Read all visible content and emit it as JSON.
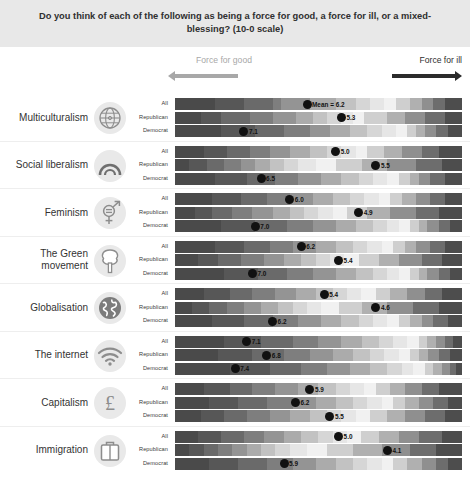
{
  "title": "Do you think of each of the following as being a force for good, a force for ill, or a mixed-blessing? (10-0 scale)",
  "legend": {
    "good_label": "Force for good",
    "ill_label": "Force for ill",
    "good_arrow_icon": "arrow-left-icon",
    "ill_arrow_icon": "arrow-right-icon"
  },
  "series_names": [
    "All",
    "Republican",
    "Democrat"
  ],
  "mean_prefix": "Mean = ",
  "chart_data": {
    "type": "bar",
    "title": "Do you think of each of the following as being a force for good, a force for ill, or a mixed-blessing? (10-0 scale)",
    "xlabel": "",
    "ylabel": "",
    "xlim": [
      10,
      0
    ],
    "scale_note": "10-0 scale: left end = force for good, right end = force for ill",
    "grid": false,
    "legend_position": "top",
    "categories": [
      "Multiculturalism",
      "Social liberalism",
      "Feminism",
      "The Green movement",
      "Globalisation",
      "The internet",
      "Capitalism",
      "Immigration"
    ],
    "groups": [
      "All",
      "Republican",
      "Democrat"
    ],
    "series": [
      {
        "name": "All",
        "values": [
          6.2,
          5.0,
          6.0,
          6.2,
          5.4,
          7.1,
          5.9,
          5.0
        ]
      },
      {
        "name": "Republican",
        "values": [
          5.3,
          5.5,
          4.9,
          5.4,
          4.6,
          6.8,
          6.2,
          4.1
        ]
      },
      {
        "name": "Democrat",
        "values": [
          7.1,
          6.5,
          7.0,
          7.0,
          6.2,
          7.4,
          5.5,
          5.9
        ]
      }
    ]
  },
  "blocks": [
    {
      "label": "Multiculturalism",
      "icon": "globe-icon",
      "rows": [
        {
          "name": "All",
          "value": "6.2",
          "label": "Mean = 6.2",
          "pos": 0.46,
          "segments": [
            14,
            10,
            10,
            3,
            10,
            9,
            7,
            5,
            5,
            4,
            5,
            4,
            4,
            4,
            6
          ]
        },
        {
          "name": "Republican",
          "value": "5.3",
          "label": "5.3",
          "pos": 0.58,
          "segments": [
            9,
            7,
            10,
            8,
            8,
            6,
            5,
            5,
            4,
            4,
            8,
            6,
            7,
            7,
            6
          ]
        },
        {
          "name": "Democrat",
          "value": "7.1",
          "label": "7.1",
          "pos": 0.24,
          "segments": [
            16,
            12,
            10,
            9,
            7,
            7,
            6,
            5,
            5,
            4,
            3,
            3,
            4,
            4,
            5
          ]
        }
      ]
    },
    {
      "label": "Social liberalism",
      "icon": "arch-icon",
      "rows": [
        {
          "name": "All",
          "value": "5.0",
          "label": "5.0",
          "pos": 0.56,
          "segments": [
            10,
            8,
            8,
            7,
            7,
            7,
            6,
            5,
            5,
            4,
            6,
            6,
            7,
            6,
            8
          ]
        },
        {
          "name": "Republican",
          "value": "5.5",
          "label": "5.5",
          "pos": 0.7,
          "segments": [
            5,
            6,
            6,
            6,
            5,
            5,
            5,
            5,
            6,
            7,
            9,
            9,
            10,
            9,
            7
          ]
        },
        {
          "name": "Democrat",
          "value": "6.5",
          "label": "6.5",
          "pos": 0.3,
          "segments": [
            14,
            11,
            10,
            8,
            8,
            7,
            6,
            5,
            5,
            4,
            4,
            3,
            4,
            5,
            6
          ]
        }
      ]
    },
    {
      "label": "Feminism",
      "icon": "gender-equality-icon",
      "rows": [
        {
          "name": "All",
          "value": "6.0",
          "label": "6.0",
          "pos": 0.4,
          "segments": [
            13,
            10,
            9,
            8,
            8,
            7,
            6,
            5,
            5,
            4,
            4,
            5,
            5,
            5,
            6
          ]
        },
        {
          "name": "Republican",
          "value": "4.9",
          "label": "4.9",
          "pos": 0.64,
          "segments": [
            7,
            6,
            7,
            7,
            7,
            6,
            5,
            5,
            5,
            5,
            7,
            8,
            9,
            8,
            8
          ]
        },
        {
          "name": "Democrat",
          "value": "7.0",
          "label": "7.0",
          "pos": 0.28,
          "segments": [
            16,
            12,
            11,
            9,
            8,
            7,
            6,
            5,
            4,
            4,
            3,
            3,
            4,
            4,
            4
          ]
        }
      ]
    },
    {
      "label": "The Green movement",
      "icon": "tree-icon",
      "rows": [
        {
          "name": "All",
          "value": "6.2",
          "label": "6.2",
          "pos": 0.44,
          "segments": [
            14,
            10,
            9,
            8,
            8,
            7,
            6,
            5,
            5,
            4,
            4,
            4,
            5,
            5,
            6
          ]
        },
        {
          "name": "Republican",
          "value": "5.4",
          "label": "5.4",
          "pos": 0.57,
          "segments": [
            8,
            7,
            8,
            8,
            7,
            6,
            5,
            5,
            5,
            5,
            7,
            7,
            8,
            7,
            7
          ]
        },
        {
          "name": "Democrat",
          "value": "7.0",
          "label": "7.0",
          "pos": 0.27,
          "segments": [
            17,
            12,
            10,
            9,
            8,
            7,
            6,
            5,
            4,
            4,
            3,
            3,
            4,
            4,
            4
          ]
        }
      ]
    },
    {
      "label": "Globalisation",
      "icon": "globe-world-icon",
      "rows": [
        {
          "name": "All",
          "value": "5.4",
          "label": "5.4",
          "pos": 0.52,
          "segments": [
            10,
            9,
            8,
            8,
            7,
            7,
            6,
            5,
            5,
            5,
            5,
            6,
            6,
            6,
            7
          ]
        },
        {
          "name": "Republican",
          "value": "4.6",
          "label": "4.6",
          "pos": 0.7,
          "segments": [
            6,
            6,
            6,
            6,
            6,
            6,
            5,
            5,
            5,
            6,
            8,
            9,
            9,
            9,
            8
          ]
        },
        {
          "name": "Democrat",
          "value": "6.2",
          "label": "6.2",
          "pos": 0.34,
          "segments": [
            13,
            11,
            10,
            9,
            8,
            7,
            6,
            5,
            5,
            4,
            4,
            4,
            4,
            5,
            5
          ]
        }
      ]
    },
    {
      "label": "The internet",
      "icon": "wifi-icon",
      "rows": [
        {
          "name": "All",
          "value": "7.1",
          "label": "7.1",
          "pos": 0.25,
          "segments": [
            17,
            13,
            11,
            9,
            8,
            7,
            6,
            5,
            5,
            4,
            3,
            3,
            3,
            3,
            3
          ]
        },
        {
          "name": "Republican",
          "value": "6.8",
          "label": "6.8",
          "pos": 0.32,
          "segments": [
            15,
            12,
            11,
            9,
            8,
            7,
            6,
            5,
            5,
            4,
            3,
            3,
            4,
            4,
            4
          ]
        },
        {
          "name": "Democrat",
          "value": "7.4",
          "label": "7.4",
          "pos": 0.21,
          "segments": [
            19,
            14,
            11,
            9,
            8,
            7,
            6,
            5,
            4,
            4,
            3,
            3,
            3,
            2,
            2
          ]
        }
      ]
    },
    {
      "label": "Capitalism",
      "icon": "pound-icon",
      "rows": [
        {
          "name": "All",
          "value": "5.9",
          "label": "5.9",
          "pos": 0.47,
          "segments": [
            10,
            9,
            8,
            8,
            8,
            7,
            6,
            5,
            5,
            4,
            5,
            5,
            6,
            6,
            8
          ]
        },
        {
          "name": "Republican",
          "value": "6.2",
          "label": "6.2",
          "pos": 0.42,
          "segments": [
            12,
            10,
            10,
            9,
            8,
            7,
            6,
            5,
            5,
            4,
            4,
            5,
            5,
            5,
            5
          ]
        },
        {
          "name": "Democrat",
          "value": "5.5",
          "label": "5.5",
          "pos": 0.54,
          "segments": [
            9,
            8,
            8,
            8,
            7,
            7,
            6,
            5,
            5,
            5,
            6,
            6,
            7,
            7,
            6
          ]
        }
      ]
    },
    {
      "label": "Immigration",
      "icon": "suitcase-icon",
      "rows": [
        {
          "name": "All",
          "value": "5.0",
          "label": "5.0",
          "pos": 0.57,
          "segments": [
            8,
            8,
            8,
            7,
            7,
            6,
            6,
            5,
            5,
            5,
            6,
            7,
            7,
            8,
            7
          ]
        },
        {
          "name": "Republican",
          "value": "4.1",
          "label": "4.1",
          "pos": 0.74,
          "segments": [
            5,
            5,
            5,
            5,
            5,
            5,
            5,
            5,
            6,
            7,
            9,
            10,
            10,
            9,
            9
          ]
        },
        {
          "name": "Democrat",
          "value": "5.9",
          "label": "5.9",
          "pos": 0.38,
          "segments": [
            12,
            10,
            10,
            9,
            8,
            7,
            6,
            5,
            5,
            4,
            5,
            5,
            5,
            4,
            5
          ]
        }
      ]
    }
  ]
}
